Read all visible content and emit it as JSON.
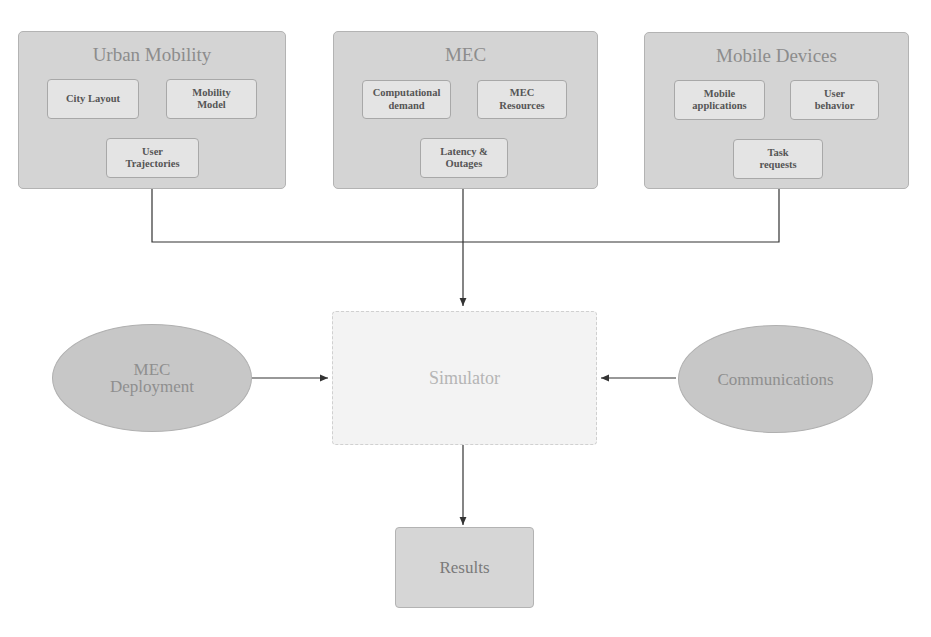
{
  "groups": [
    {
      "title": "Urban Mobility",
      "items": [
        "City Layout",
        "Mobility\nModel",
        "User\nTrajectories"
      ]
    },
    {
      "title": "MEC",
      "items": [
        "Computational\ndemand",
        "MEC\nResources",
        "Latency &\nOutages"
      ]
    },
    {
      "title": "Mobile Devices",
      "items": [
        "Mobile\napplications",
        "User\nbehavior",
        "Task\nrequests"
      ]
    }
  ],
  "inputs": {
    "left": "MEC\nDeployment",
    "right": "Communications"
  },
  "center": "Simulator",
  "output": "Results",
  "colors": {
    "group_fill": "#d4d4d4",
    "sub_fill": "#e4e4e4",
    "ellipse_fill": "#c7c7c7",
    "simulator_fill": "#f3f3f3",
    "line": "#333333"
  }
}
